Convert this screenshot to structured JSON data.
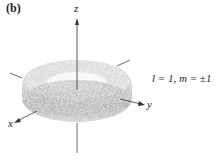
{
  "panel_label": "(b)",
  "axes": {
    "z": "z",
    "x": "x",
    "y": "y"
  },
  "caption": "l = 1, m = ±1",
  "colors": {
    "axis": "#444444",
    "cloud": "#9a9a9a"
  }
}
